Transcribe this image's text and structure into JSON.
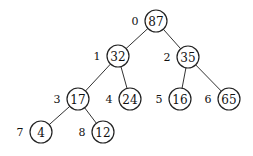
{
  "diagram": {
    "type": "binary-heap-tree",
    "nodes": [
      {
        "index": "0",
        "value": "87",
        "x": 156,
        "y": 21
      },
      {
        "index": "1",
        "value": "32",
        "x": 118,
        "y": 56
      },
      {
        "index": "2",
        "value": "35",
        "x": 188,
        "y": 57
      },
      {
        "index": "3",
        "value": "17",
        "x": 78,
        "y": 99
      },
      {
        "index": "4",
        "value": "24",
        "x": 130,
        "y": 99
      },
      {
        "index": "5",
        "value": "16",
        "x": 180,
        "y": 99
      },
      {
        "index": "6",
        "value": "65",
        "x": 229,
        "y": 99
      },
      {
        "index": "7",
        "value": "4",
        "x": 41,
        "y": 132
      },
      {
        "index": "8",
        "value": "12",
        "x": 103,
        "y": 132
      }
    ],
    "edges": [
      [
        0,
        1
      ],
      [
        0,
        2
      ],
      [
        1,
        3
      ],
      [
        1,
        4
      ],
      [
        2,
        5
      ],
      [
        2,
        6
      ],
      [
        3,
        7
      ],
      [
        3,
        8
      ]
    ]
  }
}
